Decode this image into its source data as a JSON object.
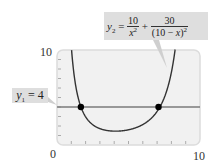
{
  "chart_data": {
    "type": "line",
    "title": "",
    "xlabel": "",
    "ylabel": "",
    "xlim": [
      0,
      10
    ],
    "ylim": [
      0,
      10
    ],
    "x_tick_labels": [
      "0",
      "10"
    ],
    "y_tick_labels": [
      "10"
    ],
    "minor_ticks": {
      "x": [
        1,
        2,
        3,
        4,
        5,
        6,
        7,
        8,
        9
      ],
      "y": [
        1,
        2,
        3,
        4,
        5,
        6,
        7,
        8,
        9
      ]
    },
    "grid": false,
    "series": [
      {
        "name": "y2 = 10/x^2 + 30/(10 - x)^2",
        "formula": "10/x^2 + 30/(10-x)^2",
        "color": "#333333",
        "x": [
          1.0,
          1.2,
          1.4,
          1.67,
          2.0,
          2.5,
          3.0,
          3.5,
          4.0,
          4.5,
          5.0,
          5.5,
          6.0,
          6.5,
          7.1,
          7.5,
          8.0,
          8.3
        ],
        "values": [
          10.37,
          7.29,
          5.51,
          4.0,
          2.97,
          2.13,
          1.72,
          1.53,
          1.46,
          1.49,
          1.6,
          1.81,
          2.15,
          2.69,
          4.0,
          4.98,
          7.66,
          10.53
        ]
      },
      {
        "name": "y1 = 4",
        "formula": "4",
        "color": "#777777",
        "x": [
          0,
          10
        ],
        "values": [
          4,
          4
        ]
      }
    ],
    "intersection_points": [
      {
        "x": 1.67,
        "y": 4
      },
      {
        "x": 7.1,
        "y": 4
      }
    ],
    "annotations": [
      {
        "label": "y1 = 4",
        "points_to": "horizontal line"
      },
      {
        "label": "y2 = 10/x^2 + 30/(10 - x)^2",
        "points_to": "right branch of curve"
      }
    ]
  },
  "labels": {
    "y_max": "10",
    "x_min": "0",
    "x_max": "10",
    "y1_var": "y",
    "y1_sub": "1",
    "y1_rest": " = 4",
    "y2_var": "y",
    "y2_sub": "2",
    "y2_eq": " = ",
    "frac1_num": "10",
    "frac1_den_var": "x",
    "frac1_den_exp": "2",
    "plus": " + ",
    "frac2_num": "30",
    "frac2_den": "(10 − ",
    "frac2_den_var": "x",
    "frac2_den_close": ")",
    "frac2_den_exp": "2"
  },
  "colors": {
    "plot_bg": "#f1f1f1",
    "plot_border": "#dcdcdc",
    "curve": "#333333",
    "hline": "#7a7a7a",
    "point": "#000000",
    "callout_bg": "#dedede"
  }
}
